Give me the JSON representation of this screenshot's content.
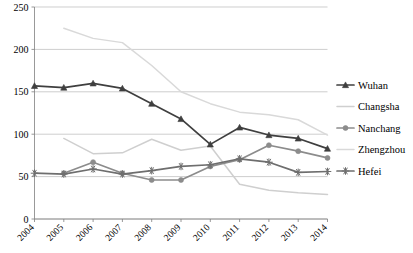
{
  "chart_data": {
    "type": "line",
    "title": "",
    "subtitle": "",
    "xlabel": "",
    "ylabel": "",
    "x": [
      2004,
      2005,
      2006,
      2007,
      2008,
      2009,
      2010,
      2011,
      2012,
      2013,
      2014
    ],
    "categories": [
      "2004",
      "2005",
      "2006",
      "2007",
      "2008",
      "2009",
      "2010",
      "2011",
      "2012",
      "2013",
      "2014"
    ],
    "xtick_labels": [
      "2004",
      "2005",
      "2006",
      "2007",
      "2008",
      "2009",
      "2010",
      "2011",
      "2012",
      "2013",
      "2014"
    ],
    "ytick_labels": [
      "0",
      "50",
      "100",
      "150",
      "200",
      "250"
    ],
    "yticks": [
      0,
      50,
      100,
      150,
      200,
      250
    ],
    "ylim": [
      0,
      250
    ],
    "grid": "horizontal",
    "legend_position": "right",
    "series": [
      {
        "name": "Wuhan",
        "color": "#3f3f3f",
        "marker": "triangle",
        "values": [
          157,
          155,
          160,
          154,
          136,
          118,
          88,
          108,
          99,
          95,
          83
        ]
      },
      {
        "name": "Changsha",
        "color": "#cfcfcf",
        "marker": "none",
        "values": [
          null,
          95,
          77,
          78,
          94,
          81,
          86,
          41,
          34,
          31,
          29
        ]
      },
      {
        "name": "Nanchang",
        "color": "#8c8c8c",
        "marker": "circle",
        "values": [
          null,
          54,
          67,
          54,
          46,
          46,
          62,
          70,
          87,
          80,
          72
        ]
      },
      {
        "name": "Zhengzhou",
        "color": "#d9d9d9",
        "marker": "none",
        "values": [
          null,
          225,
          213,
          208,
          181,
          150,
          136,
          126,
          123,
          117,
          99
        ]
      },
      {
        "name": "Hefei",
        "color": "#6e6e6e",
        "marker": "asterisk",
        "values": [
          54,
          53,
          59,
          53,
          57,
          62,
          64,
          71,
          67,
          55,
          56
        ]
      }
    ]
  },
  "legend": {
    "items": [
      {
        "label": "Wuhan"
      },
      {
        "label": "Changsha"
      },
      {
        "label": "Nanchang"
      },
      {
        "label": "Zhengzhou"
      },
      {
        "label": "Hefei"
      }
    ]
  }
}
